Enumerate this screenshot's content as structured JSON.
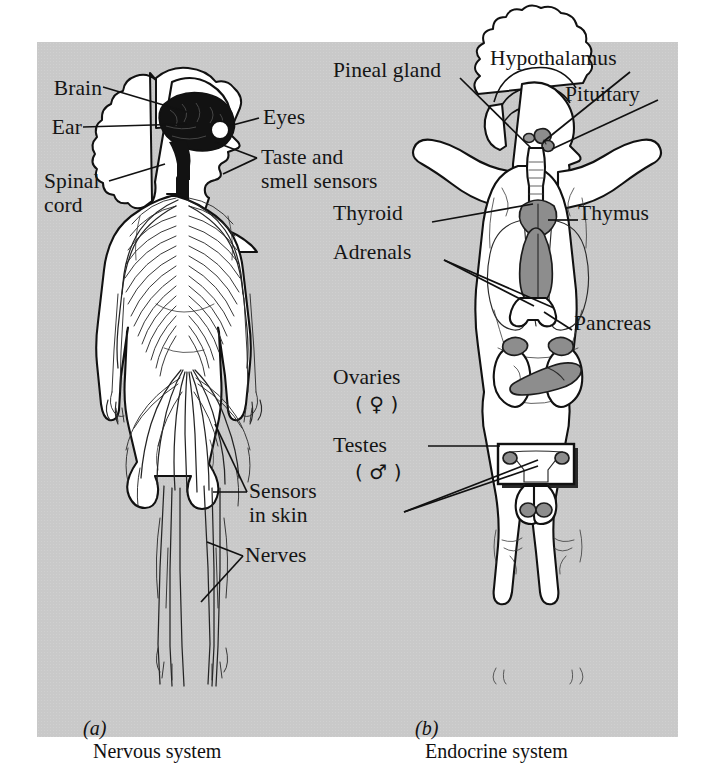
{
  "figure": {
    "panel_bg": "#c9c9c9",
    "ink": "#151515",
    "gland_fill": "#8d8d8d"
  },
  "nervous": {
    "caption_letter": "(a)",
    "caption_text": "Nervous system",
    "labels": {
      "brain": "Brain",
      "ear": "Ear",
      "spinal_line1": "Spinal",
      "spinal_line2": "cord",
      "eyes": "Eyes",
      "taste_line1": "Taste and",
      "taste_line2": "smell sensors",
      "sensors_line1": "Sensors",
      "sensors_line2": "in skin",
      "nerves": "Nerves"
    }
  },
  "endocrine": {
    "caption_letter": "(b)",
    "caption_text": "Endocrine system",
    "labels": {
      "pineal": "Pineal gland",
      "hypothalamus": "Hypothalamus",
      "pituitary": "Pituitary",
      "thyroid": "Thyroid",
      "thymus": "Thymus",
      "adrenals": "Adrenals",
      "pancreas": "Pancreas",
      "ovaries": "Ovaries",
      "ovaries_symbol": "( ♀ )",
      "testes": "Testes",
      "testes_symbol": "( ♂ )"
    }
  }
}
